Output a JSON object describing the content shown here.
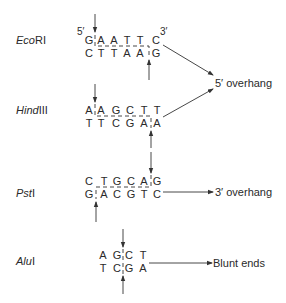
{
  "colors": {
    "ink": "#2a2a2a",
    "background": "#ffffff"
  },
  "enzymes": [
    {
      "name_italic": "Eco",
      "name_roman": "RI",
      "top_strand": [
        "G",
        "A",
        "A",
        "T",
        "T",
        "C"
      ],
      "bottom_strand": [
        "C",
        "T",
        "T",
        "A",
        "A",
        "G"
      ],
      "top_prime": "5′",
      "end_prime": "3′",
      "result": "5′ overhang"
    },
    {
      "name_italic": "Hind",
      "name_roman": "III",
      "top_strand": [
        "A",
        "A",
        "G",
        "C",
        "T",
        "T"
      ],
      "bottom_strand": [
        "T",
        "T",
        "C",
        "G",
        "A",
        "A"
      ],
      "result": "5′ overhang"
    },
    {
      "name_italic": "Pst",
      "name_roman": "I",
      "top_strand": [
        "C",
        "T",
        "G",
        "C",
        "A",
        "G"
      ],
      "bottom_strand": [
        "G",
        "A",
        "C",
        "G",
        "T",
        "C"
      ],
      "result": "3′ overhang"
    },
    {
      "name_italic": "Alu",
      "name_roman": "I",
      "top_strand": [
        "A",
        "G",
        "C",
        "T"
      ],
      "bottom_strand": [
        "T",
        "C",
        "G",
        "A"
      ],
      "result": "Blunt ends"
    }
  ],
  "outcomes": {
    "five_prime": "5′ overhang",
    "three_prime": "3′ overhang",
    "blunt": "Blunt ends"
  }
}
